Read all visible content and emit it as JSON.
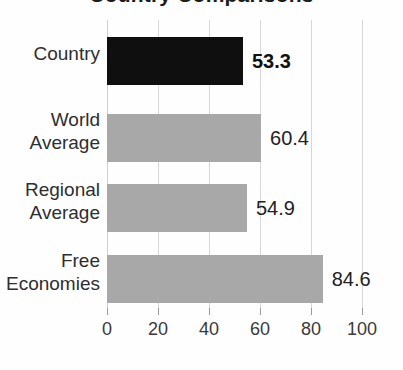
{
  "chart_data": {
    "type": "bar",
    "orientation": "horizontal",
    "title": "Country Comparisons",
    "xlabel": "",
    "ylabel": "",
    "xlim": [
      0,
      100
    ],
    "xticks": [
      "0",
      "20",
      "40",
      "60",
      "80",
      "100"
    ],
    "grid": true,
    "legend": "none",
    "categories": [
      "Country",
      "World Average",
      "Regional Average",
      "Free Economies"
    ],
    "values": [
      53.3,
      54.9,
      60.4,
      84.6
    ],
    "bars": [
      {
        "category": "Country",
        "line1": "Country",
        "line2": "",
        "value": 53.3,
        "value_label": "53.3",
        "color": "#0f0f0f",
        "emphasis": true
      },
      {
        "category": "World Average",
        "line1": "World",
        "line2": "Average",
        "value": 60.4,
        "value_label": "60.4",
        "color": "#a8a8a8",
        "emphasis": false
      },
      {
        "category": "Regional Average",
        "line1": "Regional",
        "line2": "Average",
        "value": 54.9,
        "value_label": "54.9",
        "color": "#a8a8a8",
        "emphasis": false
      },
      {
        "category": "Free Economies",
        "line1": "Free",
        "line2": "Economies",
        "value": 84.6,
        "value_label": "84.6",
        "color": "#a8a8a8",
        "emphasis": false
      }
    ]
  },
  "colors": {
    "highlight_bar": "#0f0f0f",
    "default_bar": "#a8a8a8",
    "gridline": "#d8d8d8",
    "text": "#2e2e2e",
    "background": "#fefefe"
  }
}
